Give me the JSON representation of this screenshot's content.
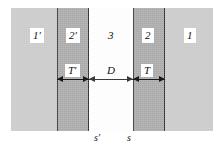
{
  "figure": {
    "type": "physics-schematic",
    "width": 224,
    "height": 150
  },
  "regions": [
    {
      "id": "1p",
      "label": "1′",
      "role": "outer-left-medium"
    },
    {
      "id": "2p",
      "label": "2′",
      "role": "barrier-left-dark"
    },
    {
      "id": "3",
      "label": "3",
      "role": "middle-clear"
    },
    {
      "id": "2",
      "label": "2",
      "role": "barrier-right-dark"
    },
    {
      "id": "1",
      "label": "1",
      "role": "outer-right-medium"
    }
  ],
  "dimensions": [
    {
      "id": "Tp",
      "label": "T′",
      "meaning": "left barrier thickness"
    },
    {
      "id": "D",
      "label": "D",
      "meaning": "separation between barriers"
    },
    {
      "id": "T",
      "label": "T",
      "meaning": "right barrier thickness"
    }
  ],
  "interfaces": [
    {
      "id": "sp",
      "label": "s′",
      "meaning": "left interface coordinate"
    },
    {
      "id": "s",
      "label": "s",
      "meaning": "right interface coordinate"
    }
  ],
  "colors": {
    "outer_gray": "#c8c8c8",
    "barrier_gray": "#a6a6a6",
    "middle_white": "#fdfdfd",
    "border_black": "#2b2b2b",
    "arrow_black": "#1a1a1a",
    "text": "#111111",
    "page_background": "#ffffff"
  }
}
